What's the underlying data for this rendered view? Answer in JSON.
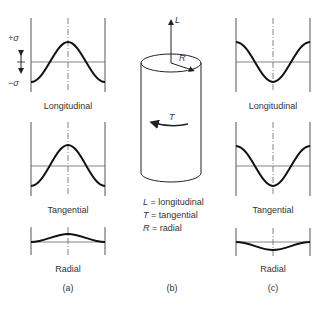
{
  "panels": {
    "a": {
      "caption": "(a)",
      "axis_labels": {
        "plus": "+σ",
        "minus": "−σ"
      },
      "plots": [
        {
          "label": "Longitudinal",
          "shape": "cosine-peak",
          "amplitude": "full"
        },
        {
          "label": "Tangential",
          "shape": "cosine-peak",
          "amplitude": "full"
        },
        {
          "label": "Radial",
          "shape": "cosine-peak",
          "amplitude": "small"
        }
      ]
    },
    "b": {
      "caption": "(b)",
      "cylinder_labels": {
        "L": "L",
        "R": "R",
        "T": "T"
      },
      "legend": [
        {
          "symbol": "L",
          "text": " = longitudinal"
        },
        {
          "symbol": "T",
          "text": " = tangential"
        },
        {
          "symbol": "R",
          "text": " = radial"
        }
      ]
    },
    "c": {
      "caption": "(c)",
      "plots": [
        {
          "label": "Longitudinal",
          "shape": "cosine-trough",
          "amplitude": "full"
        },
        {
          "label": "Tangential",
          "shape": "cosine-trough",
          "amplitude": "full"
        },
        {
          "label": "Radial",
          "shape": "cosine-trough",
          "amplitude": "small"
        }
      ]
    }
  },
  "colors": {
    "curve": "#111111",
    "axis": "#555555",
    "text": "#333333"
  }
}
